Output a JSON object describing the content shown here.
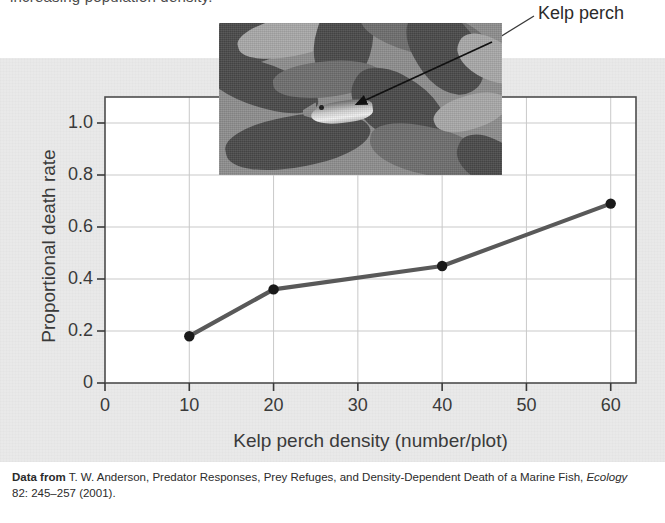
{
  "caption_cut": "increasing population density.",
  "annotation": {
    "label": "Kelp perch",
    "photo_alt": "kelp-perch-photo"
  },
  "citation": {
    "prefix": "Data from",
    "authors": " T. W. Anderson, Predator Responses, Prey Refuges, and Density-Dependent Death  of a Marine Fish, ",
    "journal": "Ecology",
    "rest": " 82: 245–257 (2001)."
  },
  "chart_data": {
    "type": "line",
    "title": "",
    "xlabel": "Kelp perch density (number/plot)",
    "ylabel": "Proportional death rate",
    "x": [
      10,
      20,
      40,
      60
    ],
    "values": [
      0.18,
      0.36,
      0.45,
      0.69
    ],
    "xlim": [
      0,
      63
    ],
    "ylim": [
      0,
      1.1
    ],
    "xticks": [
      "0",
      "10",
      "20",
      "30",
      "40",
      "50",
      "60"
    ],
    "xtick_values": [
      0,
      10,
      20,
      30,
      40,
      50,
      60
    ],
    "yticks": [
      "0",
      "0.2",
      "0.4",
      "0.6",
      "0.8",
      "1.0"
    ],
    "ytick_values": [
      0,
      0.2,
      0.4,
      0.6,
      0.8,
      1.0
    ],
    "grid": true,
    "legend": "none",
    "series": [
      {
        "name": "Proportional death rate",
        "points": [
          {
            "x": 10,
            "y": 0.18
          },
          {
            "x": 20,
            "y": 0.36
          },
          {
            "x": 40,
            "y": 0.45
          },
          {
            "x": 60,
            "y": 0.69
          }
        ]
      }
    ]
  },
  "colors": {
    "panel_background": "#e9e9e9",
    "plot_background": "#ffffff",
    "line": "#595959",
    "marker": "#1a1a1a",
    "grid": "#c9c9c9",
    "frame": "#4d4d4d",
    "text": "#3a3a3a"
  }
}
